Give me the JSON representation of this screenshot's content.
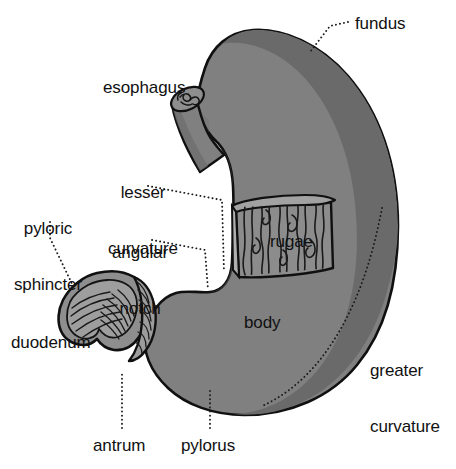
{
  "diagram": {
    "background_color": "#ffffff",
    "outline_color": "#101010",
    "fill_color": "#808080",
    "rim_color": "#6a6a6a",
    "interior_color": "#9a9a9a",
    "rugae_color": "#8c8c8c",
    "text_color": "#111111",
    "leader_style": "dotted"
  },
  "labels": {
    "fundus": "fundus",
    "esophagus": "esophagus",
    "lesser_curvature_line1": "lesser",
    "lesser_curvature_line2": "curvature",
    "pyloric_sphincter_line1": "pyloric",
    "pyloric_sphincter_line2": "sphincter",
    "angular_notch_line1": "angular",
    "angular_notch_line2": "notch",
    "rugae": "rugae",
    "body": "body",
    "duodenum": "duodenum",
    "greater_curvature_line1": "greater",
    "greater_curvature_line2": "curvature",
    "antrum": "antrum",
    "pylorus": "pylorus"
  }
}
